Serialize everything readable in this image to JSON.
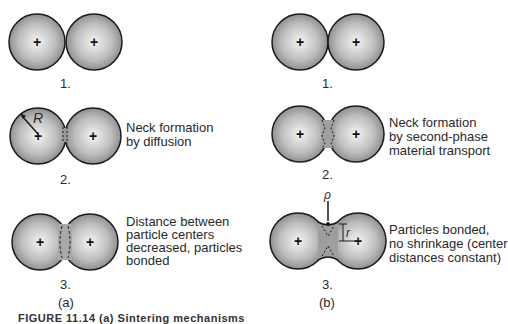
{
  "figure": {
    "panels": [
      {
        "label": "(a)",
        "steps": [
          {
            "number": "1.",
            "description": ""
          },
          {
            "number": "2.",
            "description_lines": [
              "Neck formation",
              "by diffusion"
            ],
            "radius_label": "R"
          },
          {
            "number": "3.",
            "description_lines": [
              "Distance between",
              "particle centers",
              "decreased, particles",
              "bonded"
            ]
          }
        ]
      },
      {
        "label": "(b)",
        "steps": [
          {
            "number": "1.",
            "description": ""
          },
          {
            "number": "2.",
            "description_lines": [
              "Neck formation",
              "by second-phase",
              "material transport"
            ]
          },
          {
            "number": "3.",
            "description_lines": [
              "Particles bonded,",
              "no shrinkage (center",
              "distances constant)"
            ],
            "rho_label": "ρ",
            "r_label": "r"
          }
        ]
      }
    ],
    "center_marker": "+",
    "caption": "FIGURE 11.14 (a) Sintering mechanisms"
  },
  "colors": {
    "particle_light": "#f2f2f2",
    "particle_dark": "#8a8a8a",
    "outline": "#1a1a1a",
    "text": "#2a2a2a"
  }
}
